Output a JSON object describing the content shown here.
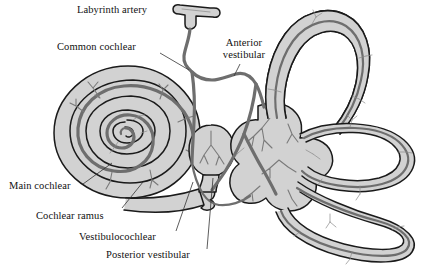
{
  "figure": {
    "background_color": "#ffffff",
    "vessel_color": "#6e6e6e",
    "structure_fill": "#d2d2d2",
    "outline_color": "#1a1a1a",
    "leader_color": "#333333"
  },
  "labels": {
    "labyrinth_artery": "Labyrinth artery",
    "common_cochlear": "Common cochlear",
    "anterior_vestibular_line1": "Anterior",
    "anterior_vestibular_line2": "vestibular",
    "main_cochlear": "Main cochlear",
    "cochlear_ramus": "Cochlear ramus",
    "vestibulocochlear": "Vestibulocochlear",
    "posterior_vestibular": "Posterior vestibular"
  },
  "structures": [
    {
      "name": "cochlea",
      "description": "spiral cochlea, 2.5 turns"
    },
    {
      "name": "saccule",
      "description": "oval saccule"
    },
    {
      "name": "vestibule",
      "description": "central vestibule / utricle"
    },
    {
      "name": "superior-semicircular-canal",
      "description": "tall loop, upper right"
    },
    {
      "name": "lateral-semicircular-canal",
      "description": "horizontal loop, right"
    },
    {
      "name": "posterior-semicircular-canal",
      "description": "large loop, lower right"
    }
  ],
  "vessels": [
    {
      "name": "labyrinth-artery",
      "description": "T-shaped trunk at top"
    },
    {
      "name": "common-cochlear-artery",
      "description": "descends to cochlea"
    },
    {
      "name": "anterior-vestibular-artery",
      "description": "runs right to vestibule"
    },
    {
      "name": "main-cochlear-artery",
      "description": "spirals through cochlea"
    },
    {
      "name": "cochlear-ramus",
      "description": "branch to basal turn"
    },
    {
      "name": "vestibulocochlear-artery",
      "description": "branch near saccule"
    },
    {
      "name": "posterior-vestibular-artery",
      "description": "branch to posterior canal"
    }
  ]
}
